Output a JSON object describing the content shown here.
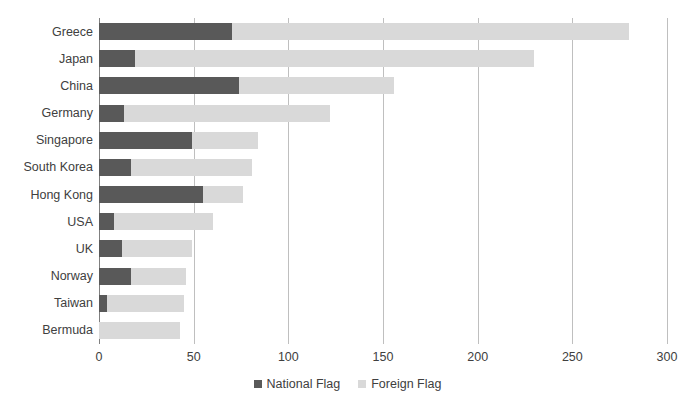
{
  "chart_data": {
    "type": "bar",
    "subtype": "stacked-horizontal-bar",
    "title": "",
    "xlabel": "",
    "ylabel": "",
    "xlim": [
      0,
      300
    ],
    "xticks": [
      "0",
      "50",
      "100",
      "150",
      "200",
      "250",
      "300"
    ],
    "grid": true,
    "legend_position": "bottom-center",
    "categories": [
      "Greece",
      "Japan",
      "China",
      "Germany",
      "Singapore",
      "South Korea",
      "Hong Kong",
      "USA",
      "UK",
      "Norway",
      "Taiwan",
      "Bermuda"
    ],
    "series": [
      {
        "name": "National Flag",
        "color": "#595959",
        "values": [
          70,
          19,
          74,
          13,
          49,
          17,
          55,
          8,
          12,
          17,
          4,
          0
        ]
      },
      {
        "name": "Foreign Flag",
        "color": "#d9d9d9",
        "values": [
          210,
          211,
          82,
          109,
          35,
          64,
          21,
          52,
          37,
          29,
          41,
          43
        ]
      }
    ],
    "totals": [
      280,
      230,
      156,
      122,
      84,
      81,
      76,
      60,
      49,
      46,
      45,
      43
    ]
  },
  "legend": {
    "items": [
      {
        "label": "National Flag",
        "swatch": "national-flag-swatch"
      },
      {
        "label": "Foreign Flag",
        "swatch": "foreign-flag-swatch"
      }
    ]
  },
  "colors": {
    "national_flag": "#595959",
    "foreign_flag": "#d9d9d9",
    "gridline": "#bfbfbf",
    "axis": "#808080",
    "text": "#404040",
    "background": "#ffffff"
  }
}
